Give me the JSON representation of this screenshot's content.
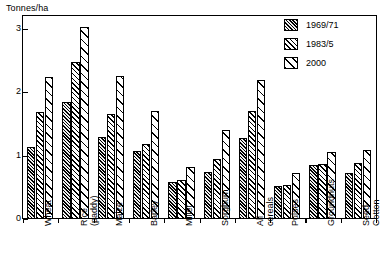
{
  "chart_data": {
    "type": "bar",
    "title": "",
    "subtitle": "",
    "xlabel": "",
    "ylabel": "Tonnes/ha",
    "ylim": [
      0,
      3.2
    ],
    "yticks": [
      0,
      1,
      2,
      3
    ],
    "ytick_labels": [
      "0",
      "1",
      "2",
      "3"
    ],
    "grid": false,
    "legend_position": "top-right",
    "categories": [
      "Wheat",
      "Rice (paddy)",
      "Maize",
      "Barley",
      "Millet",
      "Sorghum",
      "All cereals",
      "Pulses",
      "Groundnuts",
      "Seed-Cotton"
    ],
    "category_lines": [
      [
        "Wheat",
        ""
      ],
      [
        "Rice",
        "(paddy)"
      ],
      [
        "Maize",
        ""
      ],
      [
        "Barley",
        ""
      ],
      [
        "Millet",
        ""
      ],
      [
        "Sorghum",
        ""
      ],
      [
        "All",
        "cereals"
      ],
      [
        "Pulses",
        ""
      ],
      [
        "Groundnuts",
        ""
      ],
      [
        "Seed-",
        "Cotton"
      ]
    ],
    "series": [
      {
        "name": "1969/71",
        "pattern": "dense-dark-hatch",
        "values": [
          1.13,
          1.85,
          1.29,
          1.07,
          0.58,
          0.74,
          1.27,
          0.52,
          0.85,
          0.72
        ]
      },
      {
        "name": "1983/5",
        "pattern": "medium-hatch",
        "values": [
          1.68,
          2.48,
          1.65,
          1.18,
          0.61,
          0.95,
          1.7,
          0.53,
          0.86,
          0.89
        ]
      },
      {
        "name": "2000",
        "pattern": "sparse-hatch",
        "values": [
          2.24,
          3.03,
          2.26,
          1.71,
          0.82,
          1.4,
          2.19,
          0.72,
          1.05,
          1.09
        ]
      }
    ]
  },
  "legend": {
    "items": [
      {
        "label": "1969/71"
      },
      {
        "label": "1983/5"
      },
      {
        "label": "2000"
      }
    ]
  },
  "colors": {
    "axis": "#000000",
    "background": "#ffffff",
    "series_1969_71": "#3a3a3a",
    "series_1983_5": "#ffffff",
    "series_2000": "#ffffff"
  }
}
